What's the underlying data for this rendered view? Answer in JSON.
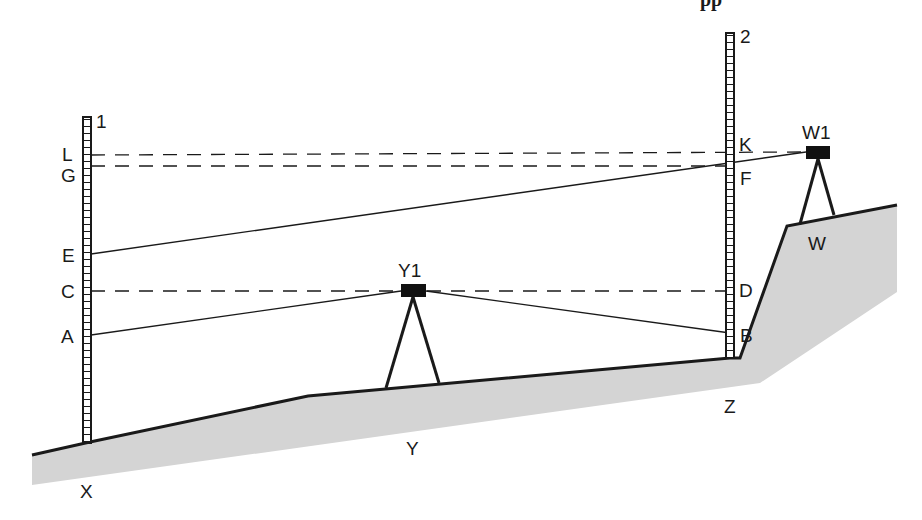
{
  "diagram": {
    "type": "surveying-leveling-diagram",
    "title_fragment": "pp",
    "colors": {
      "ground_fill": "#d4d4d4",
      "line": "#1a1a1a",
      "background": "#ffffff"
    },
    "staffs": [
      {
        "id": "staff-1",
        "label": "1"
      },
      {
        "id": "staff-2",
        "label": "2"
      }
    ],
    "staff1_points": {
      "L": "L",
      "G": "G",
      "E": "E",
      "C": "C",
      "A": "A"
    },
    "staff2_points": {
      "K": "K",
      "F": "F",
      "D": "D",
      "B": "B"
    },
    "instruments": {
      "Y1": "Y1",
      "W1": "W1"
    },
    "ground_points": {
      "X": "X",
      "Y": "Y",
      "Z": "Z",
      "W": "W"
    },
    "sight_lines": [
      {
        "from": "E",
        "to": "W1",
        "through": "F",
        "style": "solid"
      },
      {
        "from": "A",
        "to": "Y1",
        "style": "solid"
      },
      {
        "from": "Y1",
        "to": "B",
        "style": "solid"
      },
      {
        "from": "L",
        "to": "W1",
        "through": "K",
        "style": "dashed"
      },
      {
        "from": "G",
        "to": "F",
        "style": "dashed"
      },
      {
        "from": "C",
        "to": "D",
        "through": "Y1",
        "style": "dashed"
      }
    ]
  }
}
